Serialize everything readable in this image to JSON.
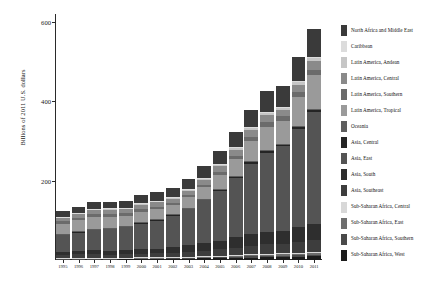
{
  "chart_data": {
    "type": "bar",
    "stacked": true,
    "title": "",
    "subtitle": "",
    "xlabel": "",
    "ylabel": "Billions of 2011 U.S. dollars",
    "ylim": [
      0,
      620
    ],
    "yticks": [
      200,
      400,
      600
    ],
    "grid": false,
    "legend_position": "right",
    "categories": [
      "1995",
      "1996",
      "1997",
      "1998",
      "1999",
      "2000",
      "2001",
      "2002",
      "2003",
      "2004",
      "2005",
      "2006",
      "2007",
      "2008",
      "2009",
      "2010",
      "2011"
    ],
    "series": [
      {
        "name": "Sub-Saharan Africa, West",
        "color": "#1c1c1c",
        "values": [
          1.8,
          2.0,
          2.2,
          2.3,
          2.5,
          2.7,
          2.9,
          3.2,
          3.6,
          4.1,
          4.7,
          5.4,
          6.2,
          7.0,
          7.4,
          8.2,
          9.0
        ]
      },
      {
        "name": "Sub-Saharan Africa, Southern",
        "color": "#4a4a4a",
        "values": [
          1.2,
          1.3,
          1.4,
          1.4,
          1.5,
          1.6,
          1.6,
          1.8,
          2.1,
          2.4,
          2.7,
          3.1,
          3.5,
          3.8,
          3.9,
          4.2,
          4.5
        ]
      },
      {
        "name": "Sub-Saharan Africa, East",
        "color": "#6e6e6e",
        "values": [
          1.0,
          1.1,
          1.2,
          1.2,
          1.3,
          1.4,
          1.5,
          1.7,
          1.9,
          2.2,
          2.5,
          2.9,
          3.3,
          3.7,
          3.9,
          4.3,
          4.8
        ]
      },
      {
        "name": "Sub-Saharan Africa, Central",
        "color": "#d8d8d8",
        "values": [
          0.5,
          0.5,
          0.6,
          0.6,
          0.6,
          0.7,
          0.7,
          0.8,
          0.9,
          1.0,
          1.2,
          1.4,
          1.6,
          1.8,
          1.9,
          2.1,
          2.3
        ]
      },
      {
        "name": "Asia, Southeast",
        "color": "#3d3d3d",
        "values": [
          9.0,
          9.8,
          10.2,
          8.0,
          8.6,
          9.6,
          10.0,
          11.0,
          12.4,
          14.2,
          16.0,
          18.4,
          21.0,
          23.0,
          22.5,
          26.0,
          29.0
        ]
      },
      {
        "name": "Asia, South",
        "color": "#2e2e2e",
        "values": [
          7.5,
          8.2,
          9.0,
          9.6,
          10.6,
          11.4,
          12.2,
          13.6,
          15.8,
          18.6,
          21.8,
          25.6,
          30.0,
          32.5,
          33.5,
          38.0,
          42.0
        ]
      },
      {
        "name": "Asia, East",
        "color": "#545454",
        "values": [
          42.0,
          47.0,
          52.0,
          55.0,
          59.0,
          65.0,
          71.0,
          80.0,
          92.0,
          108.0,
          126.0,
          149.0,
          177.0,
          198.0,
          214.0,
          248.0,
          282.0
        ]
      },
      {
        "name": "Asia, Central",
        "color": "#242424",
        "values": [
          1.4,
          1.4,
          1.5,
          1.5,
          1.5,
          1.7,
          1.9,
          2.1,
          2.4,
          2.8,
          3.3,
          3.9,
          4.6,
          5.2,
          5.0,
          5.6,
          6.2
        ]
      },
      {
        "name": "Oceania",
        "color": "#5e5e5e",
        "values": [
          0.6,
          0.6,
          0.6,
          0.6,
          0.7,
          0.7,
          0.7,
          0.8,
          0.9,
          1.0,
          1.1,
          1.2,
          1.4,
          1.5,
          1.5,
          1.7,
          1.8
        ]
      },
      {
        "name": "Latin America, Tropical",
        "color": "#9a9a9a",
        "values": [
          26.0,
          28.0,
          30.0,
          29.0,
          25.0,
          27.0,
          26.0,
          24.0,
          26.0,
          30.0,
          36.0,
          43.0,
          52.0,
          60.0,
          58.0,
          72.0,
          84.0
        ]
      },
      {
        "name": "Latin America, Southern",
        "color": "#6b6b6b",
        "values": [
          6.2,
          6.6,
          7.2,
          7.2,
          6.4,
          6.4,
          5.8,
          4.2,
          4.8,
          5.6,
          6.6,
          7.8,
          9.2,
          10.6,
          10.2,
          12.4,
          14.2
        ]
      },
      {
        "name": "Latin America, Central",
        "color": "#8a8a8a",
        "values": [
          7.8,
          8.6,
          9.4,
          9.8,
          10.4,
          11.4,
          11.6,
          11.8,
          12.2,
          13.0,
          14.2,
          15.6,
          17.2,
          18.2,
          17.0,
          19.0,
          21.0
        ]
      },
      {
        "name": "Latin America, Andean",
        "color": "#c6c6c6",
        "values": [
          2.4,
          2.6,
          2.8,
          2.8,
          2.6,
          2.7,
          2.8,
          2.9,
          3.1,
          3.5,
          4.0,
          4.6,
          5.4,
          6.2,
          6.0,
          7.0,
          8.0
        ]
      },
      {
        "name": "Caribbean",
        "color": "#dcdcdc",
        "values": [
          0.9,
          1.0,
          1.0,
          1.1,
          1.1,
          1.2,
          1.2,
          1.2,
          1.3,
          1.4,
          1.5,
          1.7,
          1.9,
          2.1,
          2.0,
          2.2,
          2.4
        ]
      },
      {
        "name": "North Africa and Middle East",
        "color": "#3a3a3a",
        "values": [
          14.0,
          15.0,
          16.0,
          16.5,
          17.5,
          19.5,
          20.5,
          22.0,
          24.5,
          28.0,
          32.5,
          38.0,
          45.0,
          52.0,
          51.0,
          60.0,
          70.0
        ]
      }
    ],
    "totals": [
      122.3,
      133.7,
      145.1,
      146.6,
      148.3,
      162.0,
      170.4,
      185.1,
      203.9,
      235.8,
      274.1,
      321.6,
      379.3,
      427.6,
      437.8,
      510.7,
      581.2
    ],
    "legend_entries": [
      "North Africa and Middle East",
      "Caribbean",
      "Latin America, Andean",
      "Latin America, Central",
      "Latin America, Southern",
      "Latin America, Tropical",
      "Oceania",
      "Asia, Central",
      "Asia, East",
      "Asia, South",
      "Asia, Southeast",
      "Sub-Saharan Africa, Central",
      "Sub-Saharan Africa, East",
      "Sub-Saharan Africa, Southern",
      "Sub-Saharan Africa, West"
    ]
  }
}
